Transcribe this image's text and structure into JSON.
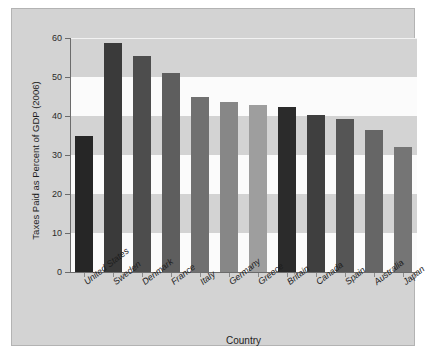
{
  "chart_data": {
    "type": "bar",
    "title": "",
    "xlabel": "Country",
    "ylabel": "Taxes Paid as Percent of GDP (2006)",
    "categories": [
      "United States",
      "Sweden",
      "Denmark",
      "France",
      "Italy",
      "Germany",
      "Greece",
      "Britain",
      "Canada",
      "Spain",
      "Australia",
      "Japan"
    ],
    "values": [
      34.8,
      58.7,
      55.5,
      51.0,
      45.0,
      43.5,
      42.8,
      42.3,
      40.3,
      39.3,
      36.3,
      32.0
    ],
    "bar_colors": [
      "#262626",
      "#3a3a3a",
      "#4d4d4d",
      "#5e5e5e",
      "#707070",
      "#878787",
      "#9e9e9e",
      "#2b2b2b",
      "#3f3f3f",
      "#555555",
      "#666666",
      "#757575"
    ],
    "ylim": [
      0,
      60
    ],
    "yticks": [
      0,
      10,
      20,
      30,
      40,
      50,
      60
    ],
    "ytick_labels": [
      "0",
      "10",
      "20",
      "30",
      "40",
      "50",
      "60"
    ],
    "grid": "horizontal-bands",
    "legend": "none",
    "plot_background": "#d3d3d3",
    "band_light_color": "#fbfbfb",
    "figure_background": "#d3d3d3",
    "axis_color": "#6b6b6b"
  }
}
